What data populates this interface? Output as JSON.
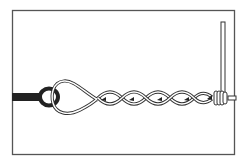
{
  "figure": {
    "description": "Line drawing of a twisted wire tie / splice: a dark rod with an eye loop on the left, a wire loop through the eye, twisted helix running right, wrapped around a vertical post on the right.",
    "colors": {
      "background": "#ffffff",
      "frame": "#555555",
      "ink": "#222222",
      "wire_fill": "#ffffff"
    },
    "parts": {
      "rod": "dark rod with eye",
      "loop": "wire loop",
      "twist": "twisted wire helix",
      "post": "vertical post",
      "wrap": "wire wraps around post"
    },
    "twist_count": 4
  }
}
